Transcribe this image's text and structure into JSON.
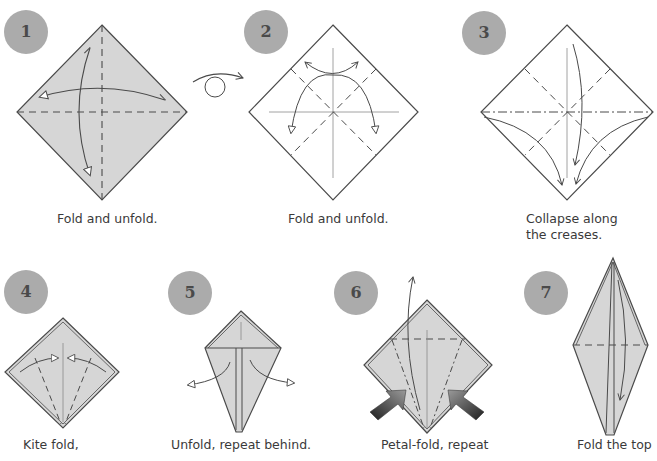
{
  "diagram": {
    "type": "origami-instructions",
    "colors": {
      "paper_colored": "#d6d6d6",
      "paper_white": "#ffffff",
      "line": "#4a4a4a",
      "badge": "#ababab",
      "badge_text": "#4a4a4a",
      "push_arrow": "#3c3c3c"
    },
    "steps": [
      {
        "number": "1",
        "caption_lines": [
          "Fold and unfold."
        ],
        "icons": [
          "valley-fold-arrow",
          "unfold-arrow"
        ]
      },
      {
        "number": "2",
        "caption_lines": [
          "Fold and unfold."
        ],
        "icons": [
          "turn-over-icon",
          "valley-fold-arrow"
        ]
      },
      {
        "number": "3",
        "caption_lines": [
          "Collapse along",
          "the creases."
        ],
        "icons": [
          "collapse-arrow"
        ]
      },
      {
        "number": "4",
        "caption_lines": [
          "Kite fold,"
        ],
        "icons": [
          "valley-fold-arrow"
        ]
      },
      {
        "number": "5",
        "caption_lines": [
          "Unfold, repeat behind."
        ],
        "icons": [
          "unfold-arrow"
        ]
      },
      {
        "number": "6",
        "caption_lines": [
          "Petal-fold, repeat"
        ],
        "icons": [
          "lift-arrow",
          "push-arrow"
        ]
      },
      {
        "number": "7",
        "caption_lines": [
          "Fold the top"
        ],
        "icons": [
          "valley-fold-arrow"
        ]
      }
    ]
  }
}
